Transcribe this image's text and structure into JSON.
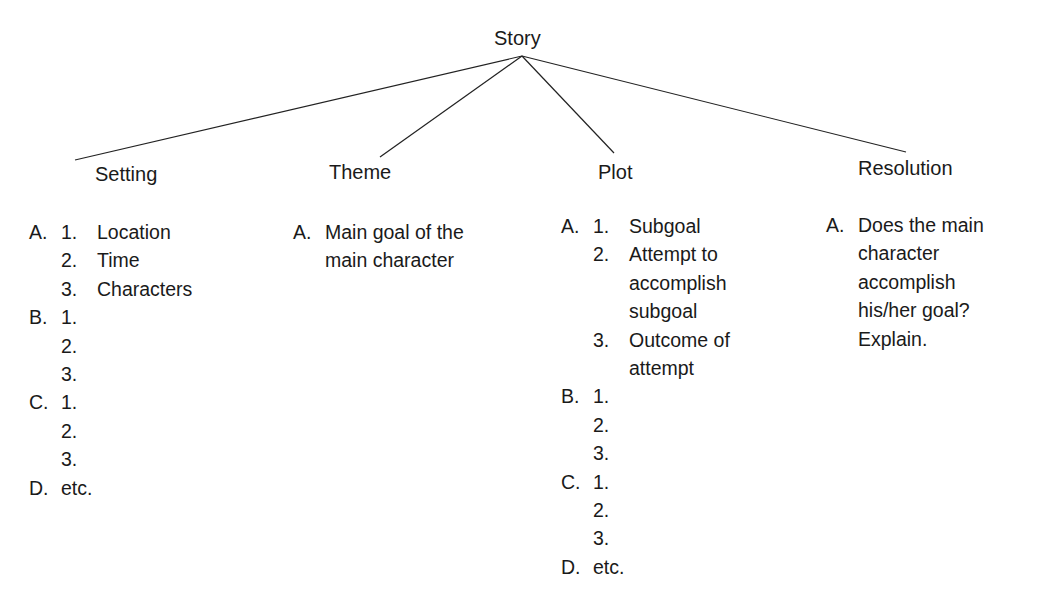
{
  "root": {
    "label": "Story"
  },
  "branches": [
    {
      "label": "Setting",
      "rows": [
        {
          "major": "A.",
          "minor": "1.",
          "text": "Location"
        },
        {
          "major": "",
          "minor": "2.",
          "text": "Time"
        },
        {
          "major": "",
          "minor": "3.",
          "text": "Characters"
        },
        {
          "major": "B.",
          "minor": "1.",
          "text": ""
        },
        {
          "major": "",
          "minor": "2.",
          "text": ""
        },
        {
          "major": "",
          "minor": "3.",
          "text": ""
        },
        {
          "major": "C.",
          "minor": "1.",
          "text": ""
        },
        {
          "major": "",
          "minor": "2.",
          "text": ""
        },
        {
          "major": "",
          "minor": "3.",
          "text": ""
        },
        {
          "major": "D.",
          "minor": "",
          "text": "etc."
        }
      ]
    },
    {
      "label": "Theme",
      "rows": [
        {
          "major": "A.",
          "text": "Main goal of the"
        },
        {
          "major": "",
          "text": "main character"
        }
      ]
    },
    {
      "label": "Plot",
      "rows": [
        {
          "major": "A.",
          "minor": "1.",
          "text": "Subgoal"
        },
        {
          "major": "",
          "minor": "2.",
          "text": "Attempt to"
        },
        {
          "major": "",
          "minor": "",
          "text": "accomplish"
        },
        {
          "major": "",
          "minor": "",
          "text": "subgoal"
        },
        {
          "major": "",
          "minor": "3.",
          "text": "Outcome of"
        },
        {
          "major": "",
          "minor": "",
          "text": "attempt"
        },
        {
          "major": "B.",
          "minor": "1.",
          "text": ""
        },
        {
          "major": "",
          "minor": "2.",
          "text": ""
        },
        {
          "major": "",
          "minor": "3.",
          "text": ""
        },
        {
          "major": "C.",
          "minor": "1.",
          "text": ""
        },
        {
          "major": "",
          "minor": "2.",
          "text": ""
        },
        {
          "major": "",
          "minor": "3.",
          "text": ""
        },
        {
          "major": "D.",
          "minor": "",
          "text": "etc."
        }
      ]
    },
    {
      "label": "Resolution",
      "rows": [
        {
          "major": "A.",
          "text": "Does the main"
        },
        {
          "major": "",
          "text": "character"
        },
        {
          "major": "",
          "text": "accomplish"
        },
        {
          "major": "",
          "text": "his/her goal?"
        },
        {
          "major": "",
          "text": "Explain."
        }
      ]
    }
  ]
}
